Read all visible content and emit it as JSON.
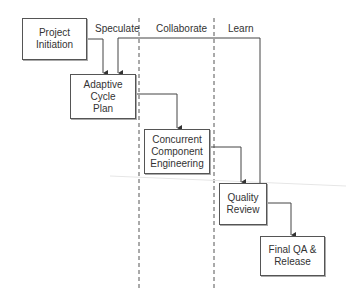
{
  "phases": [
    {
      "label": "Speculate"
    },
    {
      "label": "Collaborate"
    },
    {
      "label": "Learn"
    }
  ],
  "nodes": [
    {
      "id": "project-initiation",
      "label": "Project\nInitiation"
    },
    {
      "id": "adaptive-cycle-plan",
      "label": "Adaptive\nCycle\nPlan"
    },
    {
      "id": "concurrent-component-engineering",
      "label": "Concurrent\nComponent\nEngineering"
    },
    {
      "id": "quality-review",
      "label": "Quality\nReview"
    },
    {
      "id": "final-qa-release",
      "label": "Final QA &\nRelease"
    }
  ],
  "edges": [
    {
      "from": "project-initiation",
      "to": "adaptive-cycle-plan"
    },
    {
      "from": "adaptive-cycle-plan",
      "to": "concurrent-component-engineering"
    },
    {
      "from": "concurrent-component-engineering",
      "to": "quality-review"
    },
    {
      "from": "quality-review",
      "to": "final-qa-release"
    },
    {
      "from": "quality-review",
      "to": "adaptive-cycle-plan",
      "type": "feedback"
    }
  ]
}
